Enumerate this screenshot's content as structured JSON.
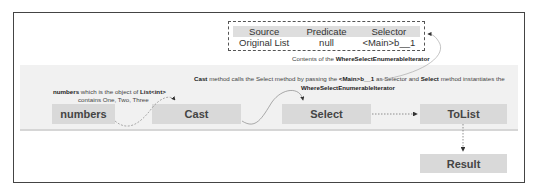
{
  "diagram": {
    "iterator_table": {
      "headers": [
        "Source",
        "Predicate",
        "Selector"
      ],
      "values": [
        "Original List",
        "null",
        "<Main>b__1"
      ],
      "caption_prefix": "Contents of the ",
      "caption_bold": "WhereSelectEnumerableIterator"
    },
    "annotations": {
      "numbers_note": {
        "bold1": "numbers",
        "text1": " which is  the object of ",
        "bold2": "List<int>",
        "line2": "contains One, Two, Three"
      },
      "cast_note": {
        "bold1": "Cast",
        "text1": " method calls the Select method by passing the ",
        "bold2": "<Main>b__1",
        "text2": " as Selector and ",
        "bold3": "Select",
        "text3": " method instantiates the",
        "line2_bold": "WhereSelectEnumerableIterator"
      }
    },
    "nodes": {
      "numbers": "numbers",
      "cast": "Cast",
      "select": "Select",
      "tolist": "ToList",
      "result": "Result"
    },
    "colors": {
      "node_fill": "#d9d9d9",
      "band_fill": "#f1f1f1",
      "border": "#444444"
    }
  }
}
